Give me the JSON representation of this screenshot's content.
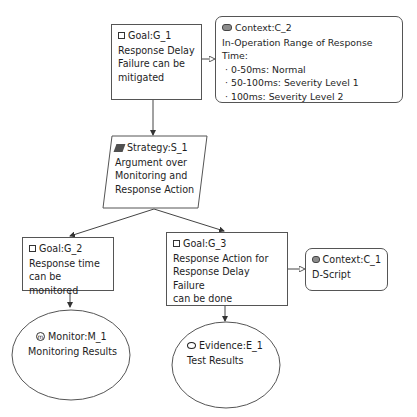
{
  "diagram": {
    "type": "GSN assurance case",
    "nodes": {
      "g1": {
        "kind": "Goal",
        "id_label": "Goal:G_1",
        "icon": "goal-square-icon",
        "lines": [
          "Response Delay",
          "Failure can be",
          "mitigated"
        ]
      },
      "c2": {
        "kind": "Context",
        "id_label": "Context:C_2",
        "icon": "context-rounded-icon",
        "heading": "In-Operation Range of Response Time:",
        "bullets": [
          "0-50ms: Normal",
          "50-100ms: Severity Level 1",
          "100ms: Severity Level 2"
        ]
      },
      "s1": {
        "kind": "Strategy",
        "id_label": "Strategy:S_1",
        "icon": "strategy-parallelogram-icon",
        "lines": [
          "Argument over",
          "Monitoring and",
          "Response Action"
        ]
      },
      "g2": {
        "kind": "Goal",
        "id_label": "Goal:G_2",
        "icon": "goal-square-icon",
        "lines": [
          "Response time",
          "can be monitored"
        ]
      },
      "g3": {
        "kind": "Goal",
        "id_label": "Goal:G_3",
        "icon": "goal-square-icon",
        "lines": [
          "Response Action for",
          "Response Delay Failure",
          "can be done"
        ]
      },
      "c1": {
        "kind": "Context",
        "id_label": "Context:C_1",
        "icon": "context-rounded-icon",
        "lines": [
          "D-Script"
        ]
      },
      "m1": {
        "kind": "Monitor",
        "id_label": "Monitor:M_1",
        "icon": "monitor-m-icon",
        "icon_glyph": "m",
        "lines": [
          "Monitoring Results"
        ]
      },
      "e1": {
        "kind": "Evidence",
        "id_label": "Evidence:E_1",
        "icon": "evidence-circle-icon",
        "lines": [
          "Test Results"
        ]
      }
    },
    "edges": [
      {
        "from": "g1",
        "to": "c2",
        "type": "in-context-of"
      },
      {
        "from": "g1",
        "to": "s1",
        "type": "supported-by"
      },
      {
        "from": "s1",
        "to": "g2",
        "type": "supported-by"
      },
      {
        "from": "s1",
        "to": "g3",
        "type": "supported-by"
      },
      {
        "from": "g3",
        "to": "c1",
        "type": "in-context-of"
      },
      {
        "from": "g2",
        "to": "m1",
        "type": "supported-by"
      },
      {
        "from": "g3",
        "to": "e1",
        "type": "supported-by"
      }
    ],
    "colors": {
      "line": "#444444",
      "border": "#555555",
      "context_icon_fill": "#8c8c8c",
      "strategy_icon_fill": "#505050",
      "caption": "#9a9a9a"
    }
  },
  "caption": {
    "text": ""
  }
}
